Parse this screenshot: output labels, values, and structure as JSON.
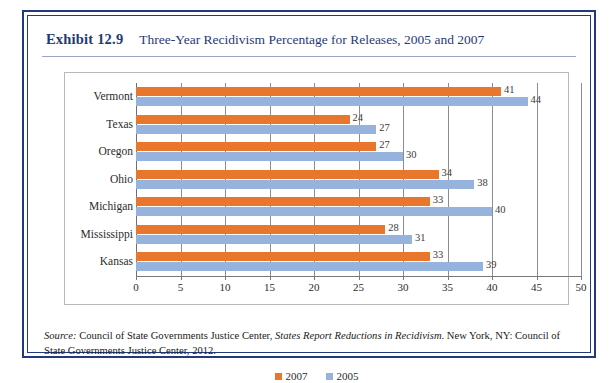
{
  "figure": {
    "exhibit_label": "Exhibit 12.9",
    "title": "Three-Year Recidivism Percentage for Releases, 2005 and 2007",
    "source_prefix": "Source:",
    "source_part1": " Council of State Governments Justice Center, ",
    "source_italic": "States Report Reductions in Recidivism",
    "source_part2": ". New York, NY: Council of State Governments Justice Center, 2012.",
    "border_color": "#22397a"
  },
  "chart_data": {
    "type": "bar",
    "orientation": "horizontal",
    "title": "Three-Year Recidivism Percentage for Releases, 2005 and 2007",
    "xlabel": "",
    "ylabel": "",
    "categories": [
      "Vermont",
      "Texas",
      "Oregon",
      "Ohio",
      "Michigan",
      "Mississippi",
      "Kansas"
    ],
    "series": [
      {
        "name": "2007",
        "color": "#e8762d",
        "values": [
          41,
          24,
          27,
          34,
          33,
          28,
          33
        ]
      },
      {
        "name": "2005",
        "color": "#95b3dc",
        "values": [
          44,
          27,
          30,
          38,
          40,
          31,
          39
        ]
      }
    ],
    "xlim": [
      0,
      50
    ],
    "xticks": [
      0,
      5,
      10,
      15,
      20,
      25,
      30,
      35,
      40,
      45,
      50
    ],
    "xtick_labels": [
      "0",
      "5",
      "10",
      "15",
      "20",
      "25",
      "30",
      "35",
      "40",
      "45",
      "50"
    ],
    "grid": "vertical",
    "legend_position": "bottom",
    "data_labels": true
  }
}
